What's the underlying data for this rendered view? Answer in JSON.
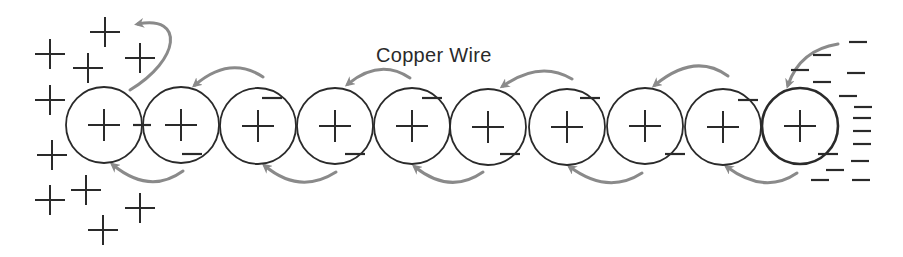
{
  "diagram": {
    "title": "Copper Wire",
    "label_position": {
      "x": 376,
      "y": 44
    },
    "colors": {
      "stroke": "#2a2a2a",
      "arrow": "#8a8a8a",
      "background": "#ffffff"
    },
    "atoms": [
      {
        "cx": 104,
        "cy": 125,
        "r": 38,
        "charge": "+",
        "neg_top": null,
        "neg_bottom": null
      },
      {
        "cx": 181,
        "cy": 125,
        "r": 38,
        "charge": "+",
        "neg_top": null,
        "neg_bottom": [
          192,
          154
        ],
        "neg_left": [
          142,
          125
        ]
      },
      {
        "cx": 258,
        "cy": 126,
        "r": 38,
        "charge": "+",
        "neg_top": [
          272,
          98
        ],
        "neg_bottom": null
      },
      {
        "cx": 335,
        "cy": 126,
        "r": 38,
        "charge": "+",
        "neg_top": null,
        "neg_bottom": [
          355,
          154
        ]
      },
      {
        "cx": 412,
        "cy": 126,
        "r": 38,
        "charge": "+",
        "neg_top": [
          432,
          98
        ],
        "neg_bottom": null
      },
      {
        "cx": 488,
        "cy": 127,
        "r": 38,
        "charge": "+",
        "neg_top": null,
        "neg_bottom": [
          510,
          154
        ]
      },
      {
        "cx": 567,
        "cy": 127,
        "r": 38,
        "charge": "+",
        "neg_top": [
          590,
          98
        ],
        "neg_bottom": null
      },
      {
        "cx": 645,
        "cy": 126,
        "r": 38,
        "charge": "+",
        "neg_top": null,
        "neg_bottom": [
          675,
          154
        ]
      },
      {
        "cx": 723,
        "cy": 127,
        "r": 38,
        "charge": "+",
        "neg_top": [
          748,
          100
        ],
        "neg_bottom": null
      },
      {
        "cx": 800,
        "cy": 126,
        "r": 38,
        "charge": "+",
        "neg_top": null,
        "neg_bottom": [
          828,
          154
        ]
      }
    ],
    "positive_cloud": [
      [
        50,
        54
      ],
      [
        105,
        32
      ],
      [
        88,
        68
      ],
      [
        140,
        58
      ],
      [
        50,
        100
      ],
      [
        52,
        155
      ],
      [
        86,
        190
      ],
      [
        50,
        200
      ],
      [
        140,
        208
      ],
      [
        103,
        230
      ]
    ],
    "negative_cloud": [
      [
        858,
        42
      ],
      [
        822,
        55
      ],
      [
        800,
        70
      ],
      [
        856,
        73
      ],
      [
        822,
        82
      ],
      [
        848,
        96
      ],
      [
        863,
        107
      ],
      [
        862,
        118
      ],
      [
        862,
        131
      ],
      [
        862,
        144
      ],
      [
        860,
        161
      ],
      [
        835,
        170
      ],
      [
        820,
        180
      ],
      [
        861,
        180
      ]
    ],
    "arrows_top": [
      {
        "from": [
          263,
          77
        ],
        "ctrl": [
          230,
          55
        ],
        "to": [
          195,
          85
        ]
      },
      {
        "from": [
          410,
          78
        ],
        "ctrl": [
          380,
          58
        ],
        "to": [
          348,
          84
        ]
      },
      {
        "from": [
          572,
          79
        ],
        "ctrl": [
          540,
          60
        ],
        "to": [
          503,
          86
        ]
      },
      {
        "from": [
          728,
          76
        ],
        "ctrl": [
          695,
          52
        ],
        "to": [
          655,
          85
        ]
      },
      {
        "from": [
          838,
          44
        ],
        "ctrl": [
          800,
          50
        ],
        "to": [
          788,
          85
        ]
      }
    ],
    "arrows_bottom": [
      {
        "from": [
          183,
          171
        ],
        "ctrl": [
          150,
          195
        ],
        "to": [
          113,
          165
        ]
      },
      {
        "from": [
          336,
          172
        ],
        "ctrl": [
          300,
          195
        ],
        "to": [
          265,
          166
        ]
      },
      {
        "from": [
          483,
          172
        ],
        "ctrl": [
          450,
          195
        ],
        "to": [
          415,
          167
        ]
      },
      {
        "from": [
          642,
          173
        ],
        "ctrl": [
          608,
          195
        ],
        "to": [
          570,
          167
        ]
      },
      {
        "from": [
          797,
          173
        ],
        "ctrl": [
          765,
          195
        ],
        "to": [
          727,
          167
        ]
      }
    ],
    "arrow_out": {
      "from": [
        130,
        90
      ],
      "ctrl1": [
        180,
        60
      ],
      "ctrl2": [
        185,
        15
      ],
      "to": [
        138,
        24
      ]
    }
  }
}
